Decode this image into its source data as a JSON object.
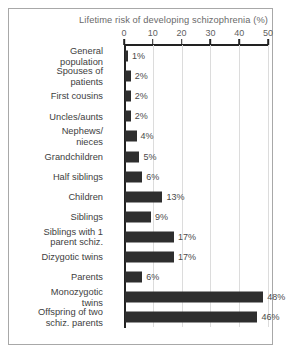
{
  "chart_data": {
    "type": "bar",
    "orientation": "horizontal",
    "title": "Lifetime risk of  developing schizophrenia (%)",
    "xlabel": "",
    "ylabel": "",
    "xlim": [
      0,
      50
    ],
    "xticks": [
      0,
      10,
      20,
      30,
      40,
      50
    ],
    "xtick_labels": [
      "0",
      "10",
      "20",
      "30",
      "40",
      "50"
    ],
    "grid": true,
    "grid_axis": "x",
    "legend": false,
    "value_label_suffix": "%",
    "bar_color": "#2e2e2e",
    "grid_color": "#dcdcdc",
    "axis_color": "#222222",
    "title_color": "#6a6a6a",
    "categories": [
      "General\npopulation",
      "Spouses of\npatients",
      "First cousins",
      "Uncles/aunts",
      "Nephews/\nnieces",
      "Grandchildren",
      "Half siblings",
      "Children",
      "Siblings",
      "Siblings with 1\nparent schiz.",
      "Dizygotic twins",
      "Parents",
      "Monozygotic\ntwins",
      "Offspring of two\nschiz. parents"
    ],
    "values": [
      1,
      2,
      2,
      2,
      4,
      5,
      6,
      13,
      9,
      17,
      17,
      6,
      48,
      46
    ],
    "value_labels": [
      "1%",
      "2%",
      "2%",
      "2%",
      "4%",
      "5%",
      "6%",
      "13%",
      "9%",
      "17%",
      "17%",
      "6%",
      "48%",
      "46%"
    ]
  }
}
